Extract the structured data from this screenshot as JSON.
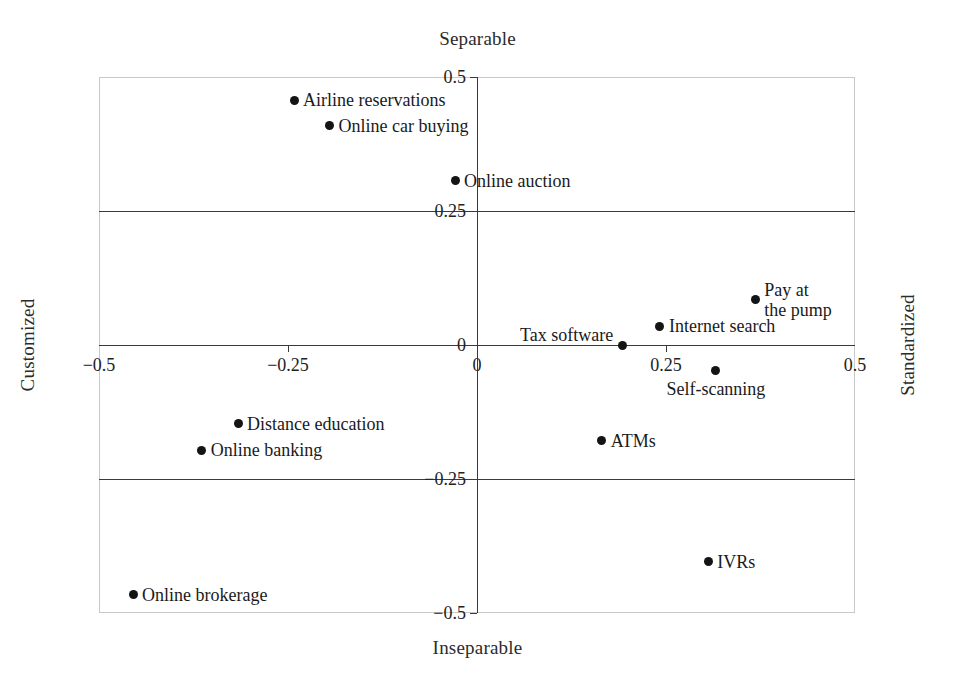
{
  "chart_data": {
    "type": "scatter",
    "title": "",
    "top_axis_title": "Separable",
    "bottom_axis_title": "Inseparable",
    "left_axis_title": "Customized",
    "right_axis_title": "Standardized",
    "xlabel": "",
    "ylabel": "",
    "xlim": [
      -0.5,
      0.5
    ],
    "ylim": [
      -0.5,
      0.5
    ],
    "grid": true,
    "gridlines_y": [
      0.25,
      -0.25
    ],
    "legend": "none",
    "xticks": [
      {
        "value": -0.5,
        "label": "−0.5"
      },
      {
        "value": -0.25,
        "label": "−0.25"
      },
      {
        "value": 0,
        "label": "0"
      },
      {
        "value": 0.25,
        "label": "0.25"
      },
      {
        "value": 0.5,
        "label": "0.5"
      }
    ],
    "yticks": [
      {
        "value": 0.5,
        "label": "0.5"
      },
      {
        "value": 0.25,
        "label": "0.25"
      },
      {
        "value": 0,
        "label": "0"
      },
      {
        "value": -0.25,
        "label": "−0.25"
      },
      {
        "value": -0.5,
        "label": "−0.5"
      }
    ],
    "points": [
      {
        "label": "Airline reservations",
        "x": -0.242,
        "y": 0.457,
        "label_pos": "right"
      },
      {
        "label": "Online car buying",
        "x": -0.195,
        "y": 0.409,
        "label_pos": "right"
      },
      {
        "label": "Online auction",
        "x": -0.029,
        "y": 0.306,
        "label_pos": "right"
      },
      {
        "label": "Pay at\nthe pump",
        "x": 0.368,
        "y": 0.084,
        "label_pos": "right"
      },
      {
        "label": "Internet search",
        "x": 0.242,
        "y": 0.035,
        "label_pos": "right"
      },
      {
        "label": "Tax software",
        "x": 0.192,
        "y": 0.0,
        "label_pos": "left"
      },
      {
        "label": "Self-scanning",
        "x": 0.316,
        "y": -0.047,
        "label_pos": "below"
      },
      {
        "label": "Distance education",
        "x": -0.316,
        "y": -0.147,
        "label_pos": "right"
      },
      {
        "label": "ATMs",
        "x": 0.165,
        "y": -0.179,
        "label_pos": "right"
      },
      {
        "label": "Online banking",
        "x": -0.364,
        "y": -0.196,
        "label_pos": "right"
      },
      {
        "label": "IVRs",
        "x": 0.306,
        "y": -0.404,
        "label_pos": "right"
      },
      {
        "label": "Online brokerage",
        "x": -0.455,
        "y": -0.466,
        "label_pos": "right"
      }
    ]
  },
  "colors": {
    "point": "#141414",
    "axis": "#3a3a3a",
    "frame": "#c9c9c9",
    "text": "#1a1a1a",
    "background": "#ffffff"
  }
}
